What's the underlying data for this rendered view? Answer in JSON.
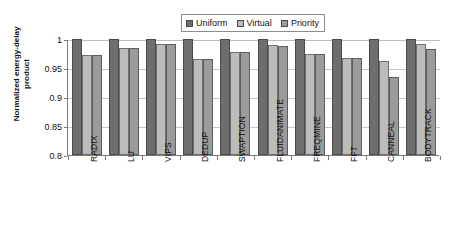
{
  "chart_data": {
    "type": "bar",
    "title": "",
    "xlabel": "",
    "ylabel": "Normalized energy-delay\nproduct",
    "ylim": [
      0.8,
      1.0
    ],
    "yticks": [
      "0.8",
      "0.85",
      "0.9",
      "0.95",
      "1"
    ],
    "ytick_values": [
      0.8,
      0.85,
      0.9,
      0.95,
      1.0
    ],
    "grid": true,
    "legend_position": "top-center",
    "categories": [
      "RADIX",
      "LU",
      "VIPS",
      "DEDUP",
      "SWAPTION",
      "FLUIDANIMATE",
      "FREQMINE",
      "FFT",
      "CANNEAL",
      "BODYTRACK"
    ],
    "series": [
      {
        "name": "Uniform",
        "color": "#6e6e6e",
        "values": [
          1.0,
          1.0,
          1.0,
          1.0,
          1.0,
          1.0,
          1.0,
          1.0,
          1.0,
          1.0
        ]
      },
      {
        "name": "Virtual",
        "color": "#bcbcbc",
        "values": [
          0.973,
          0.985,
          0.991,
          0.965,
          0.977,
          0.989,
          0.975,
          0.968,
          0.962,
          0.992
        ]
      },
      {
        "name": "Priority",
        "color": "#9b9b9b",
        "values": [
          0.973,
          0.984,
          0.991,
          0.965,
          0.977,
          0.988,
          0.974,
          0.968,
          0.934,
          0.982
        ]
      }
    ]
  },
  "legend": {
    "items": [
      {
        "label": "Uniform",
        "color": "#6e6e6e"
      },
      {
        "label": "Virtual",
        "color": "#bcbcbc"
      },
      {
        "label": "Priority",
        "color": "#9b9b9b"
      }
    ]
  },
  "axes": {
    "y_title": "Normalized energy-delay\nproduct"
  }
}
